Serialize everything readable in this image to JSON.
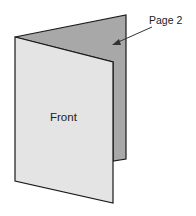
{
  "diagram": {
    "labels": {
      "front": "Front",
      "page2": "Page 2"
    },
    "colors": {
      "front_panel": "#e4e4e4",
      "back_panel": "#a8a8a8",
      "outline": "#1a1a1a"
    }
  }
}
